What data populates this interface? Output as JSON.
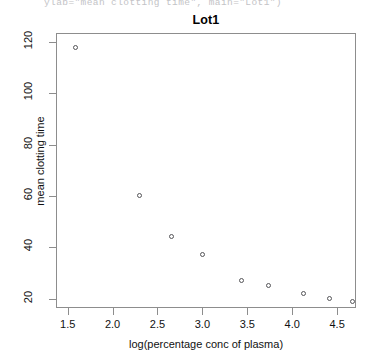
{
  "console": {
    "echo_line": "ylab=\"mean clotting time\", main=\"Lot1\")"
  },
  "figure": {
    "title": "Lot1",
    "xlabel": "log(percentage conc of plasma)",
    "ylabel": "mean clotting time"
  },
  "axes": {
    "x_ticks": [
      "1.5",
      "2.0",
      "2.5",
      "3.0",
      "3.5",
      "4.0",
      "4.5"
    ],
    "y_ticks": [
      "20",
      "40",
      "60",
      "80",
      "100",
      "120"
    ]
  },
  "colors": {
    "frame": "#8d8d8d",
    "point_stroke": "#555558",
    "text": "#111111",
    "console_text": "#b9b9bd",
    "background": "#ffffff"
  },
  "chart_data": {
    "type": "scatter",
    "title": "Lot1",
    "xlabel": "log(percentage conc of plasma)",
    "ylabel": "mean clotting time",
    "xlim": [
      1.37,
      4.71
    ],
    "ylim": [
      16.3,
      123.5
    ],
    "xticks": [
      1.5,
      2.0,
      2.5,
      3.0,
      3.5,
      4.0,
      4.5
    ],
    "yticks": [
      20,
      40,
      60,
      80,
      100,
      120
    ],
    "grid": false,
    "legend": null,
    "marker": "open-circle",
    "series": [
      {
        "name": "Lot1",
        "x": [
          1.59,
          2.3,
          2.66,
          3.0,
          3.43,
          3.74,
          4.13,
          4.42,
          4.67
        ],
        "y": [
          118,
          60,
          44,
          37,
          27,
          25,
          22,
          20,
          19
        ]
      }
    ],
    "points": [
      {
        "x": 1.59,
        "y": 118
      },
      {
        "x": 2.3,
        "y": 60
      },
      {
        "x": 2.66,
        "y": 44
      },
      {
        "x": 3.0,
        "y": 37
      },
      {
        "x": 3.43,
        "y": 27
      },
      {
        "x": 3.74,
        "y": 25
      },
      {
        "x": 4.13,
        "y": 22
      },
      {
        "x": 4.42,
        "y": 20
      },
      {
        "x": 4.67,
        "y": 19
      }
    ]
  }
}
